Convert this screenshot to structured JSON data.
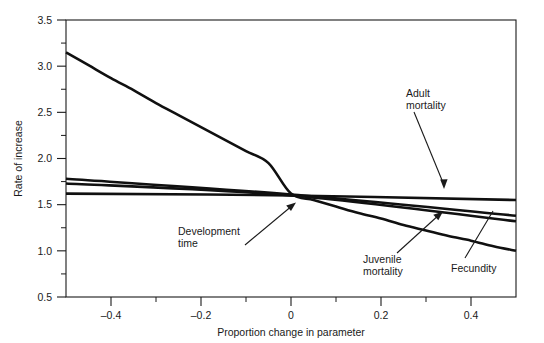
{
  "chart_data": {
    "type": "line",
    "title": "",
    "xlabel": "Proportion change in parameter",
    "ylabel": "Rate of increase",
    "xlim": [
      -0.5,
      0.5
    ],
    "ylim": [
      0.5,
      3.5
    ],
    "grid": false,
    "legend_position": "inline-annotations",
    "x_ticks_major": [
      -0.4,
      -0.2,
      0,
      0.2,
      0.4
    ],
    "x_tick_labels": [
      "–0.4",
      "–0.2",
      "0",
      "0.2",
      "0.4"
    ],
    "x_ticks_minor": [
      -0.5,
      -0.3,
      -0.1,
      0.1,
      0.3,
      0.5
    ],
    "y_ticks_major": [
      0.5,
      1.0,
      1.5,
      2.0,
      2.5,
      3.0,
      3.5
    ],
    "y_tick_labels": [
      "0.5",
      "1.0",
      "1.5",
      "2.0",
      "2.5",
      "3.0",
      "3.5"
    ],
    "y_ticks_minor": [
      0.75,
      1.25,
      1.75,
      2.25,
      2.75,
      3.25
    ],
    "series": [
      {
        "name": "Development time",
        "x": [
          -0.5,
          -0.45,
          -0.4,
          -0.35,
          -0.3,
          -0.25,
          -0.2,
          -0.15,
          -0.1,
          -0.05,
          0.0,
          0.05,
          0.1,
          0.15,
          0.2,
          0.25,
          0.3,
          0.35,
          0.4,
          0.45,
          0.5
        ],
        "values": [
          3.15,
          3.01,
          2.87,
          2.74,
          2.6,
          2.47,
          2.34,
          2.21,
          2.08,
          1.95,
          1.62,
          1.55,
          1.48,
          1.41,
          1.35,
          1.28,
          1.22,
          1.16,
          1.11,
          1.05,
          1.0
        ]
      },
      {
        "name": "Adult mortality",
        "x": [
          -0.5,
          0.0,
          0.5
        ],
        "values": [
          1.62,
          1.6,
          1.55
        ]
      },
      {
        "name": "Juvenile mortality",
        "x": [
          -0.5,
          0.0,
          0.5
        ],
        "values": [
          1.78,
          1.61,
          1.38
        ]
      },
      {
        "name": "Fecundity",
        "x": [
          -0.5,
          0.0,
          0.5
        ],
        "values": [
          1.73,
          1.6,
          1.32
        ]
      }
    ],
    "annotations": [
      {
        "label": "Adult\nmortality",
        "lines": [
          "Adult",
          "mortality"
        ]
      },
      {
        "label": "Development\ntime",
        "lines": [
          "Development",
          "time"
        ]
      },
      {
        "label": "Juvenile\nmortality",
        "lines": [
          "Juvenile",
          "mortality"
        ]
      },
      {
        "label": "Fecundity",
        "lines": [
          "Fecundity"
        ]
      }
    ],
    "colors": {
      "curve": "#101010",
      "axis": "#1a1a1a",
      "background": "#ffffff"
    }
  },
  "axes": {
    "y_title": "Rate of increase",
    "x_title": "Proportion change in parameter",
    "y_labels": {
      "t0": "0.5",
      "t1": "1.0",
      "t2": "1.5",
      "t3": "2.0",
      "t4": "2.5",
      "t5": "3.0",
      "t6": "3.5"
    },
    "x_labels": {
      "t0": "–0.4",
      "t1": "–0.2",
      "t2": "0",
      "t3": "0.2",
      "t4": "0.4"
    }
  },
  "annotations": {
    "adult_mortality": {
      "line1": "Adult",
      "line2": "mortality"
    },
    "development_time": {
      "line1": "Development",
      "line2": "time"
    },
    "juvenile_mortality": {
      "line1": "Juvenile",
      "line2": "mortality"
    },
    "fecundity": {
      "line1": "Fecundity"
    }
  }
}
